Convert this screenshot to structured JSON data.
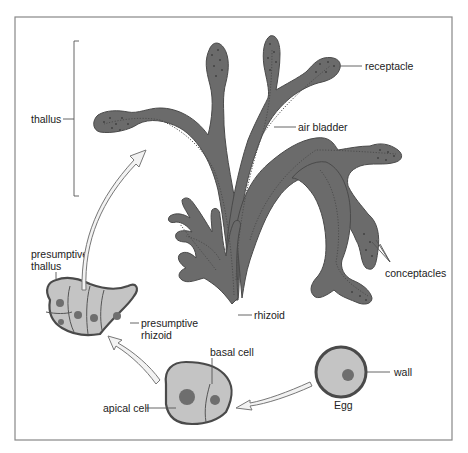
{
  "diagram": {
    "colors": {
      "plant_fill": "#6b6b6b",
      "cell_fill": "#c4c4c4",
      "outline": "#4a4a4a",
      "arrow_fill": "#f2f2f2",
      "frame": "#888888"
    },
    "labels": {
      "thallus": "thallus",
      "receptacle": "receptacle",
      "air_bladder": "air bladder",
      "conceptacles": "conceptacles",
      "rhizoid": "rhizoid",
      "presumptive_thallus_1": "presumptive",
      "presumptive_thallus_2": "thallus",
      "presumptive_rhizoid_1": "presumptive",
      "presumptive_rhizoid_2": "rhizoid",
      "basal_cell": "basal cell",
      "apical_cell": "apical cell",
      "wall": "wall",
      "egg": "Egg"
    },
    "stages": [
      {
        "id": "egg",
        "label": "Egg"
      },
      {
        "id": "two-cell",
        "label": "apical cell + basal cell"
      },
      {
        "id": "embryo",
        "label": "presumptive thallus / presumptive rhizoid"
      },
      {
        "id": "adult",
        "label": "thallus"
      }
    ],
    "arrows": [
      {
        "from": "egg",
        "to": "two-cell"
      },
      {
        "from": "two-cell",
        "to": "embryo"
      },
      {
        "from": "embryo",
        "to": "adult"
      }
    ]
  }
}
